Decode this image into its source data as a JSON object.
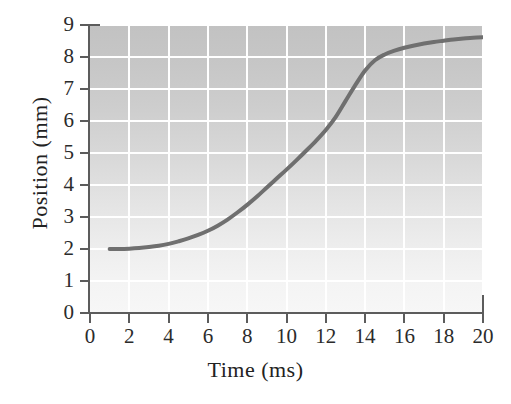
{
  "chart_data": {
    "type": "line",
    "title": "",
    "subtitle": "",
    "xlabel": "Time (ms)",
    "ylabel": "Position (mm)",
    "xlim": [
      0,
      20
    ],
    "ylim": [
      0,
      9
    ],
    "xticks": [
      0,
      2,
      4,
      6,
      8,
      10,
      12,
      14,
      16,
      18,
      20
    ],
    "yticks": [
      0,
      1,
      2,
      3,
      4,
      5,
      6,
      7,
      8,
      9
    ],
    "xtick_labels": [
      "0",
      "2",
      "4",
      "6",
      "8",
      "10",
      "12",
      "14",
      "16",
      "18",
      "20"
    ],
    "ytick_labels": [
      "0",
      "1",
      "2",
      "3",
      "4",
      "5",
      "6",
      "7",
      "8",
      "9"
    ],
    "grid": true,
    "grid_color": "#ffffff",
    "grid_x_step": 2,
    "grid_y_step": 1,
    "legend": "none",
    "plot_bg_top": "#c2c2c2",
    "plot_bg_bottom": "#f7f7f7",
    "axis_color": "#5c5c5c",
    "series": [
      {
        "name": "Position vs Time",
        "color": "#6f6f6f",
        "line_width": 4,
        "x": [
          1.0,
          1.5,
          2.0,
          2.5,
          3.0,
          3.5,
          4.0,
          4.5,
          5.0,
          5.5,
          6.0,
          6.5,
          7.0,
          7.5,
          8.0,
          8.5,
          9.0,
          9.5,
          10.0,
          10.5,
          11.0,
          11.5,
          12.0,
          12.5,
          13.0,
          13.5,
          14.0,
          14.5,
          15.0,
          15.5,
          16.0,
          16.5,
          17.0,
          17.5,
          18.0,
          18.5,
          19.0,
          19.5,
          20.0
        ],
        "y": [
          2.0,
          2.0,
          2.01,
          2.03,
          2.06,
          2.1,
          2.16,
          2.24,
          2.33,
          2.44,
          2.57,
          2.73,
          2.92,
          3.14,
          3.38,
          3.64,
          3.92,
          4.2,
          4.48,
          4.77,
          5.07,
          5.38,
          5.72,
          6.12,
          6.62,
          7.12,
          7.58,
          7.9,
          8.08,
          8.2,
          8.29,
          8.36,
          8.42,
          8.47,
          8.51,
          8.55,
          8.58,
          8.6,
          8.62
        ]
      }
    ]
  },
  "axes": {
    "x_title": "Time (ms)",
    "y_title": "Position (mm)"
  }
}
